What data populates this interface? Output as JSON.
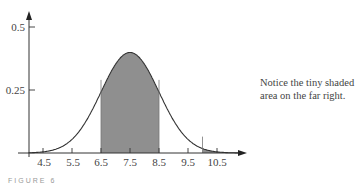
{
  "chart_data": {
    "type": "area",
    "title": "",
    "subtitle": "",
    "xlabel": "",
    "ylabel": "",
    "distribution": "normal",
    "mean": 7.5,
    "sd": 1.0,
    "x_ticks": [
      4.5,
      5.5,
      6.5,
      7.5,
      8.5,
      9.5,
      10.5
    ],
    "y_ticks": [
      0.25,
      0.5
    ],
    "xlim": [
      4.0,
      11.5
    ],
    "ylim": [
      0,
      0.55
    ],
    "grid": false,
    "legend": null,
    "shaded_regions": [
      {
        "from": 6.5,
        "to": 8.5,
        "label": "central region"
      },
      {
        "from": 10.0,
        "to": 11.5,
        "label": "tiny right tail"
      }
    ],
    "curve_points": [
      {
        "x": 4.0,
        "y": 0.001
      },
      {
        "x": 4.5,
        "y": 0.004
      },
      {
        "x": 5.0,
        "y": 0.018
      },
      {
        "x": 5.5,
        "y": 0.054
      },
      {
        "x": 6.0,
        "y": 0.13
      },
      {
        "x": 6.5,
        "y": 0.242
      },
      {
        "x": 7.0,
        "y": 0.352
      },
      {
        "x": 7.5,
        "y": 0.399
      },
      {
        "x": 8.0,
        "y": 0.352
      },
      {
        "x": 8.5,
        "y": 0.242
      },
      {
        "x": 9.0,
        "y": 0.13
      },
      {
        "x": 9.5,
        "y": 0.054
      },
      {
        "x": 10.0,
        "y": 0.018
      },
      {
        "x": 10.5,
        "y": 0.004
      },
      {
        "x": 11.0,
        "y": 0.001
      }
    ],
    "annotations": [
      "Notice the tiny shaded area on the far right."
    ]
  },
  "labels": {
    "y_ticks": [
      "0.5",
      "0.25"
    ],
    "x_ticks": [
      "4.5",
      "5.5",
      "6.5",
      "7.5",
      "8.5",
      "9.5",
      "10.5"
    ],
    "note": "Notice the tiny shaded area on the far right.",
    "caption": "FIGURE 6"
  },
  "colors": {
    "shade": "#8f8f8f",
    "curve": "#333333",
    "axis": "#333333"
  }
}
